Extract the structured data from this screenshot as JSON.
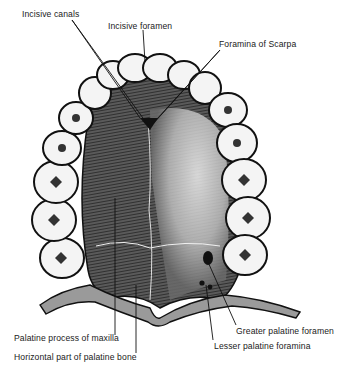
{
  "figure": {
    "labels": [
      {
        "id": "incisive-canals",
        "text": "Incisive canals",
        "x": 22,
        "y": 13
      },
      {
        "id": "incisive-foramen",
        "text": "Incisive foramen",
        "x": 108,
        "y": 25
      },
      {
        "id": "foramina-of-scarpa",
        "text": "Foramina of Scarpa",
        "x": 219,
        "y": 43
      },
      {
        "id": "palatine-process-of-maxilla",
        "text": "Palatine process of maxilla",
        "x": 14,
        "y": 337
      },
      {
        "id": "horizontal-part-of-palatine-bone",
        "text": "Horizontal part of palatine bone",
        "x": 14,
        "y": 356
      },
      {
        "id": "greater-palatine-foramen",
        "text": "Greater palatine foramen",
        "x": 236,
        "y": 330
      },
      {
        "id": "lesser-palatine-foramina",
        "text": "Lesser palatine foramina",
        "x": 214,
        "y": 344
      }
    ],
    "colors": {
      "ink": "#111111",
      "bone_dark": "#3a3a3a",
      "bone_light": "#e8e8e8",
      "tooth": "#f4f4f4",
      "background": "#ffffff"
    }
  }
}
